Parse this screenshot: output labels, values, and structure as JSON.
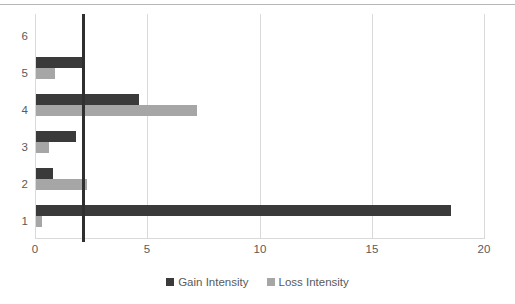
{
  "chart_data": {
    "type": "bar",
    "orientation": "horizontal",
    "title": "",
    "xlabel": "",
    "ylabel": "",
    "xlim": [
      0,
      20
    ],
    "xticks": [
      0,
      5,
      10,
      15,
      20
    ],
    "xtick_labels": [
      "0",
      "5",
      "10",
      "15",
      "20"
    ],
    "categories": [
      "1",
      "2",
      "3",
      "4",
      "5",
      "6"
    ],
    "category_order_top_to_bottom": [
      "6",
      "5",
      "4",
      "3",
      "2",
      "1"
    ],
    "grid": "vertical",
    "legend_position": "bottom-center",
    "series": [
      {
        "name": "Gain Intensity",
        "color": "#3a3a3a",
        "values": [
          18.5,
          0.8,
          1.8,
          4.6,
          2.1,
          0
        ]
      },
      {
        "name": "Loss Intensity",
        "color": "#a6a6a6",
        "values": [
          0.3,
          2.3,
          0.6,
          7.2,
          0.9,
          0
        ]
      }
    ],
    "annotations": [
      {
        "name": "threshold-line",
        "type": "vertical-line",
        "value": 2.1,
        "color": "#2f2f2f"
      }
    ]
  },
  "axes": {
    "x_tick_labels": [
      "0",
      "5",
      "10",
      "15",
      "20"
    ],
    "y_tick_labels": [
      "6",
      "5",
      "4",
      "3",
      "2",
      "1"
    ]
  },
  "legend": {
    "entries": [
      {
        "label": "Gain Intensity",
        "color": "#3a3a3a"
      },
      {
        "label": "Loss Intensity",
        "color": "#a6a6a6"
      }
    ]
  }
}
